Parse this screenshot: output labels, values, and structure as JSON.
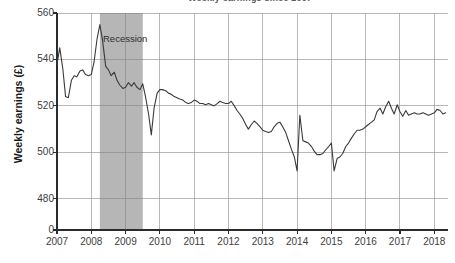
{
  "chart_data": {
    "type": "line",
    "title": "Weekly earnings since 2007",
    "xlabel": "",
    "ylabel": "Weekly earnings (£)",
    "ylim": [
      470,
      560
    ],
    "y_axis_break_at_zero": true,
    "y_ticks": [
      0,
      480,
      500,
      520,
      540,
      560
    ],
    "y_tick_labels": [
      "0",
      "480",
      "500",
      "520",
      "540",
      "560"
    ],
    "x_ticks": [
      2007,
      2008,
      2009,
      2010,
      2011,
      2012,
      2013,
      2014,
      2015,
      2016,
      2017,
      2018
    ],
    "x_tick_labels": [
      "2007",
      "2008",
      "2009",
      "2010",
      "2011",
      "2012",
      "2013",
      "2014",
      "2015",
      "2016",
      "2017",
      "2018"
    ],
    "xlim": [
      2007.0,
      2018.4
    ],
    "grid": "horizontal-and-vertical",
    "legend": "none",
    "line_color": "#3a3a3a",
    "grid_color": "#9a9a9a",
    "annotations": [
      {
        "name": "recession-band",
        "label": "Recession",
        "type": "vertical-span",
        "x_start": 2008.25,
        "x_end": 2009.5,
        "color": "#b6b6b6"
      }
    ],
    "series": [
      {
        "name": "Weekly earnings",
        "x": [
          2007.0,
          2007.08,
          2007.17,
          2007.25,
          2007.33,
          2007.42,
          2007.5,
          2007.58,
          2007.67,
          2007.75,
          2007.83,
          2007.92,
          2008.0,
          2008.08,
          2008.17,
          2008.25,
          2008.33,
          2008.42,
          2008.5,
          2008.58,
          2008.67,
          2008.75,
          2008.83,
          2008.92,
          2009.0,
          2009.08,
          2009.17,
          2009.25,
          2009.33,
          2009.42,
          2009.5,
          2009.58,
          2009.67,
          2009.75,
          2009.83,
          2009.92,
          2010.0,
          2010.08,
          2010.17,
          2010.25,
          2010.33,
          2010.42,
          2010.5,
          2010.58,
          2010.67,
          2010.75,
          2010.83,
          2010.92,
          2011.0,
          2011.08,
          2011.17,
          2011.25,
          2011.33,
          2011.42,
          2011.5,
          2011.58,
          2011.67,
          2011.75,
          2011.83,
          2011.92,
          2012.0,
          2012.08,
          2012.17,
          2012.25,
          2012.33,
          2012.42,
          2012.5,
          2012.58,
          2012.67,
          2012.75,
          2012.83,
          2012.92,
          2013.0,
          2013.08,
          2013.17,
          2013.25,
          2013.33,
          2013.42,
          2013.5,
          2013.58,
          2013.67,
          2013.75,
          2013.83,
          2013.92,
          2014.0,
          2014.08,
          2014.17,
          2014.25,
          2014.33,
          2014.42,
          2014.5,
          2014.58,
          2014.67,
          2014.75,
          2014.83,
          2014.92,
          2015.0,
          2015.08,
          2015.17,
          2015.25,
          2015.33,
          2015.42,
          2015.5,
          2015.58,
          2015.67,
          2015.75,
          2015.83,
          2015.92,
          2016.0,
          2016.08,
          2016.17,
          2016.25,
          2016.33,
          2016.42,
          2016.5,
          2016.58,
          2016.67,
          2016.75,
          2016.83,
          2016.92,
          2017.0,
          2017.08,
          2017.17,
          2017.25,
          2017.33,
          2017.42,
          2017.5,
          2017.58,
          2017.67,
          2017.75,
          2017.83,
          2017.92,
          2018.0,
          2018.08,
          2018.17,
          2018.25,
          2018.33
        ],
        "values": [
          538.0,
          545.0,
          536.0,
          524.0,
          523.5,
          531.0,
          533.0,
          532.5,
          535.0,
          535.5,
          533.5,
          533.0,
          533.5,
          539.0,
          549.0,
          555.0,
          548.0,
          537.0,
          535.5,
          533.0,
          534.5,
          531.0,
          529.0,
          527.5,
          528.0,
          530.0,
          528.5,
          530.0,
          528.0,
          527.0,
          529.5,
          524.0,
          516.5,
          507.5,
          519.0,
          525.5,
          527.0,
          527.0,
          526.5,
          525.5,
          525.0,
          524.0,
          523.5,
          523.0,
          522.5,
          521.5,
          521.0,
          521.5,
          522.5,
          522.0,
          521.0,
          521.0,
          520.5,
          521.0,
          520.5,
          520.0,
          521.0,
          522.0,
          521.5,
          521.0,
          521.0,
          522.0,
          520.0,
          518.0,
          516.5,
          514.5,
          512.0,
          510.0,
          512.0,
          513.5,
          512.5,
          511.0,
          509.5,
          509.0,
          508.5,
          509.0,
          511.0,
          512.5,
          513.0,
          511.0,
          508.5,
          505.0,
          501.5,
          498.0,
          492.0,
          516.0,
          505.0,
          504.5,
          504.0,
          502.5,
          500.5,
          499.0,
          499.0,
          499.5,
          501.0,
          502.5,
          504.0,
          492.0,
          497.5,
          498.0,
          499.5,
          502.5,
          504.0,
          506.0,
          508.0,
          509.5,
          509.5,
          510.0,
          511.0,
          512.0,
          513.0,
          514.0,
          517.5,
          519.0,
          516.5,
          519.5,
          522.0,
          519.0,
          516.5,
          520.5,
          517.5,
          515.5,
          518.0,
          516.0,
          516.5,
          517.0,
          516.5,
          516.5,
          517.0,
          516.5,
          516.0,
          516.5,
          517.0,
          518.5,
          518.0,
          516.5,
          517.0
        ]
      }
    ]
  },
  "labels": {
    "recession": "Recession",
    "y_axis_title": "Weekly earnings (£)"
  }
}
